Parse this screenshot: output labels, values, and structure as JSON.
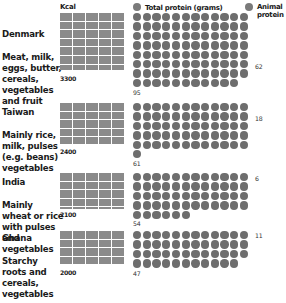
{
  "header": {
    "kcal_label": "Kcal",
    "total_protein_label": "Total protein (grams)",
    "animal_protein_label": "Animal\nprotein"
  },
  "colors": {
    "kcal_block": "#8a8a8a",
    "protein_dot": "#6e6e6e",
    "background": "#ffffff"
  },
  "countries": [
    {
      "name": "Denmark",
      "diet": "Meat, milk, eggs, butter, cereals, vegetables and fruit",
      "kcal": "3300",
      "total_protein": "95",
      "animal_protein": "62"
    },
    {
      "name": "Taiwan",
      "diet": "Mainly rice, milk, pulses (e.g. beans) vegetables",
      "kcal": "2400",
      "total_protein": "61",
      "animal_protein": "18"
    },
    {
      "name": "India",
      "diet": "Mainly wheat or rice with pulses and vegetables",
      "kcal": "2100",
      "total_protein": "54",
      "animal_protein": "6"
    },
    {
      "name": "Ghana",
      "diet": "Starchy roots and cereals, vegetables",
      "kcal": "2000",
      "total_protein": "47",
      "animal_protein": "11"
    }
  ],
  "chart_data": {
    "type": "bar",
    "categories": [
      "Denmark",
      "Taiwan",
      "India",
      "Ghana"
    ],
    "series": [
      {
        "name": "Kcal",
        "values": [
          3300,
          2400,
          2100,
          2000
        ]
      },
      {
        "name": "Total protein (grams)",
        "values": [
          95,
          61,
          54,
          47
        ]
      },
      {
        "name": "Animal protein (grams)",
        "values": [
          62,
          18,
          6,
          11
        ]
      }
    ],
    "diets": [
      "Meat, milk, eggs, butter, cereals, vegetables and fruit",
      "Mainly rice, milk, pulses (e.g. beans) vegetables",
      "Mainly wheat or rice with pulses and vegetables",
      "Starchy roots and cereals, vegetables"
    ],
    "units": {
      "kcal_block": "100 kcal per cell (5 per row)",
      "protein_dot": "1 gram per dot (12 per row)"
    },
    "legend": [
      "Kcal",
      "Total protein (grams)",
      "Animal protein"
    ],
    "grid": false
  }
}
